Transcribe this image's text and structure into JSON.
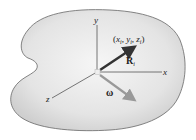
{
  "diagram": {
    "body": {
      "fill_center": "#f4f4f4",
      "fill_edge": "#d4d4d4",
      "stroke": "#666666"
    },
    "axes": {
      "x_label": "x",
      "y_label": "y",
      "z_label": "z",
      "color": "#444444"
    },
    "position_vector": {
      "label": "R",
      "subscript": "i",
      "point_label": "(x",
      "point_label_full": "(xi, yi, zi)",
      "coord_x": "x",
      "coord_y": "y",
      "coord_z": "z",
      "sub": "i",
      "color": "#333333"
    },
    "angular_velocity": {
      "label": "ω",
      "color": "#999999"
    }
  }
}
